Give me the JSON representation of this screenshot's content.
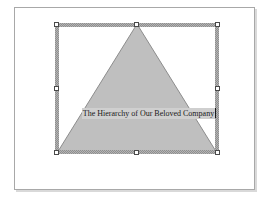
{
  "app": {
    "canvas_background": "#ffffff",
    "page_background": "#ffffff",
    "page_border_color": "#a8a8a8",
    "page_shadow_color": "#d9d9d9"
  },
  "slide": {
    "name": "slide-page"
  },
  "shape": {
    "type": "triangle",
    "semantic_name": "pyramid-hierarchy-shape",
    "fill_color": "#bfbfbf",
    "stroke_color": "#8c8c8c",
    "selected": true,
    "apex_label": "",
    "text": "The Hierarchy of Our Beloved Company",
    "text_color": "#1a1a1a",
    "text_highlight_color": "#cfcfcf",
    "text_editing": true
  },
  "selection": {
    "frame_color": "#b4b4b4",
    "frame_hatch_color": "#8e8e8e",
    "handle_fill": "#ffffff",
    "handle_border": "#4a4a4a",
    "handles": [
      {
        "id": "nw",
        "label": "top-left"
      },
      {
        "id": "n",
        "label": "top-center"
      },
      {
        "id": "ne",
        "label": "top-right"
      },
      {
        "id": "w",
        "label": "middle-left"
      },
      {
        "id": "e",
        "label": "middle-right"
      },
      {
        "id": "sw",
        "label": "bottom-left"
      },
      {
        "id": "s",
        "label": "bottom-center"
      },
      {
        "id": "se",
        "label": "bottom-right"
      }
    ]
  }
}
